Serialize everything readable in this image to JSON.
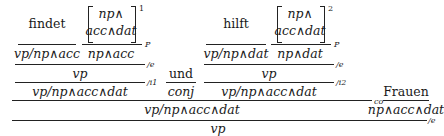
{
  "derivation": {
    "left": {
      "word": "findet",
      "word_cat": "vp/np∧acc",
      "hyp_top": "np∧",
      "hyp_bottom": "acc∧dat",
      "hyp_index": "1",
      "hyp_cat": "np∧acc",
      "hyp_rule": "P",
      "elim_result": "vp",
      "elim_rule": "/e",
      "intro_result": "vp/np∧acc∧dat",
      "intro_rule": "/i1"
    },
    "conj": {
      "word": "und",
      "cat": "conj"
    },
    "right": {
      "word": "hilft",
      "word_cat": "vp/np∧dat",
      "hyp_top": "np∧",
      "hyp_bottom": "acc∧dat",
      "hyp_index": "2",
      "hyp_cat": "np∧dat",
      "hyp_rule": "P",
      "elim_result": "vp",
      "elim_rule": "/e",
      "intro_result": "vp/np∧acc∧dat",
      "intro_rule": "/i2"
    },
    "coord": {
      "result": "vp/np∧acc∧dat",
      "rule": "co"
    },
    "object": {
      "word": "Frauen",
      "cat": "np∧acc∧dat"
    },
    "final": {
      "result": "vp",
      "rule": "/e"
    }
  }
}
